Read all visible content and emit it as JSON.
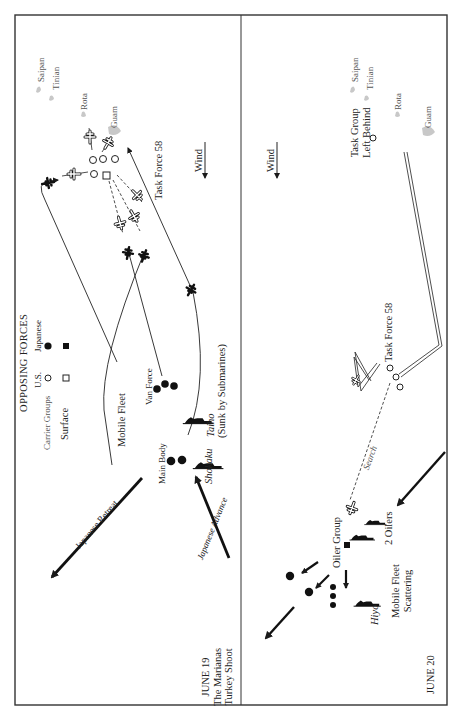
{
  "map": {
    "colors": {
      "ink": "#1a1a1a",
      "island": "#c8c8c8",
      "frame": "#333333",
      "background": "#ffffff"
    },
    "legend": {
      "title": "OPPOSING FORCES",
      "col_us": "U.S.",
      "col_japanese": "Japanese",
      "row_carrier": "Carrier Groups",
      "row_surface": "Surface",
      "symbols": {
        "us_carrier": "open-circle",
        "jp_carrier": "filled-circle",
        "us_surface": "open-square",
        "jp_surface": "filled-square"
      }
    },
    "panel_june19": {
      "date": "JUNE 19",
      "title_line1": "The Marianas",
      "title_line2": "Turkey Shoot",
      "islands": {
        "saipan": "Saipan",
        "tinian": "Tinian",
        "rota": "Rota",
        "guam": "Guam"
      },
      "task_force": "Task Force 58",
      "wind": "Wind",
      "mobile_fleet": "Mobile Fleet",
      "van_force": "Van Force",
      "main_body": "Main Body",
      "taiho": "Taiho",
      "shokaku": "Shokaku",
      "sunk_note": "(Sunk by Submarines)",
      "japanese_retreat": "Japanese Retreat",
      "japanese_advance": "Japanese Advance"
    },
    "panel_june20": {
      "date": "JUNE 20",
      "islands": {
        "saipan": "Saipan",
        "tinian": "Tinian",
        "rota": "Rota",
        "guam": "Guam"
      },
      "task_group_line1": "Task Group",
      "task_group_line2": "Left Behind",
      "wind": "Wind",
      "task_force": "Task Force 58",
      "search": "Search",
      "oiler_group": "Oiler Group",
      "oilers": "2 Oilers",
      "hiyo": "Hiyo",
      "mobile_fleet_line1": "Mobile Fleet",
      "mobile_fleet_line2": "Scattering"
    }
  }
}
